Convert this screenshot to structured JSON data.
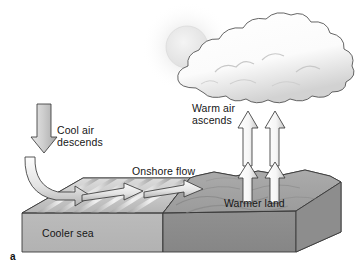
{
  "figure": {
    "letter": "a",
    "background_color": "#ffffff"
  },
  "labels": {
    "cool_air": "Cool air\ndescends",
    "onshore_flow": "Onshore flow",
    "warm_air": "Warm air\nascends",
    "warmer_land": "Warmer land",
    "cooler_sea": "Cooler sea"
  },
  "elements": {
    "sun": "sun-disc",
    "cloud": "cumulus-cloud",
    "descending_arrow": "downward-arrow",
    "curving_arrow": "curved-arrow-to-sea",
    "onshore_arrows": [
      "onshore-arrow-left",
      "onshore-arrow-right"
    ],
    "ascending_arrows": [
      "ascending-arrow-upper-left",
      "ascending-arrow-upper-right",
      "ascending-arrow-lower-left",
      "ascending-arrow-lower-right"
    ],
    "sea_block": "cooler-sea-block",
    "land_block": "warmer-land-block"
  },
  "colors": {
    "sea_top_light": "#f2f2f2",
    "sea_top_dark": "#9e9e9e",
    "sea_front": "#b9b9b9",
    "land_top": "#a4a4a4",
    "land_front": "#8f8f8f",
    "land_side": "#9a9a9a",
    "arrow_fill": "#fbfbfb",
    "arrow_shade": "#c9c9c9",
    "outline": "#3a3a3a",
    "cloud_fill": "#ffffff",
    "cloud_shade": "#d5d5d5",
    "sun_fill": "#ededed",
    "text": "#161616"
  }
}
